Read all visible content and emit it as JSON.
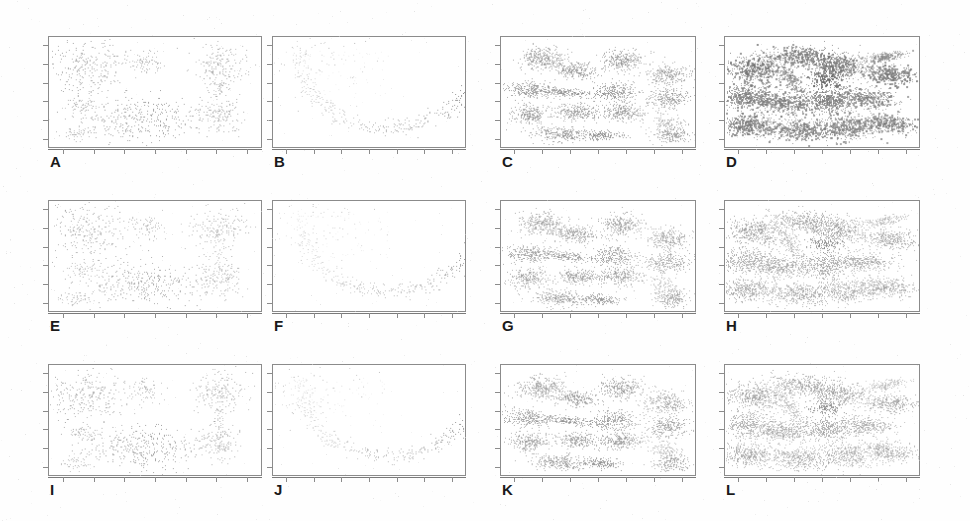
{
  "figure": {
    "width": 970,
    "height": 521,
    "background": "#ffffff",
    "rows": 3,
    "columns": 4,
    "frame_color": "#8b8b8b",
    "label_color": "#1a1a1a"
  },
  "panels": [
    {
      "id": "A",
      "label": "A",
      "row": 0,
      "col": 0,
      "dataset": "blobs-varied",
      "method": "row-1",
      "point_color": "#b9b9b9",
      "density": "sparse"
    },
    {
      "id": "B",
      "label": "B",
      "row": 0,
      "col": 1,
      "dataset": "crescent-arc",
      "method": "row-1",
      "point_color": "#bdbdbd",
      "density": "sparse"
    },
    {
      "id": "C",
      "label": "C",
      "row": 0,
      "col": 2,
      "dataset": "anisotropic-grid",
      "method": "row-1",
      "point_color": "#9a9a9a",
      "density": "dense"
    },
    {
      "id": "D",
      "label": "D",
      "row": 0,
      "col": 3,
      "dataset": "overlapping-mix",
      "method": "row-1",
      "point_color": "#7d7d7d",
      "density": "very-dense"
    },
    {
      "id": "E",
      "label": "E",
      "row": 1,
      "col": 0,
      "dataset": "blobs-varied",
      "method": "row-2",
      "point_color": "#c4c4c4",
      "density": "sparse"
    },
    {
      "id": "F",
      "label": "F",
      "row": 1,
      "col": 1,
      "dataset": "crescent-arc",
      "method": "row-2",
      "point_color": "#c6c6c6",
      "density": "sparse"
    },
    {
      "id": "G",
      "label": "G",
      "row": 1,
      "col": 2,
      "dataset": "anisotropic-grid",
      "method": "row-2",
      "point_color": "#a6a6a6",
      "density": "dense"
    },
    {
      "id": "H",
      "label": "H",
      "row": 1,
      "col": 3,
      "dataset": "overlapping-mix",
      "method": "row-2",
      "point_color": "#9d9d9d",
      "density": "dense"
    },
    {
      "id": "I",
      "label": "I",
      "row": 2,
      "col": 0,
      "dataset": "blobs-varied",
      "method": "row-3",
      "point_color": "#bfbfbf",
      "density": "sparse"
    },
    {
      "id": "J",
      "label": "J",
      "row": 2,
      "col": 1,
      "dataset": "crescent-arc",
      "method": "row-3",
      "point_color": "#c2c2c2",
      "density": "sparse"
    },
    {
      "id": "K",
      "label": "K",
      "row": 2,
      "col": 2,
      "dataset": "anisotropic-grid",
      "method": "row-3",
      "point_color": "#a2a2a2",
      "density": "dense"
    },
    {
      "id": "L",
      "label": "L",
      "row": 2,
      "col": 3,
      "dataset": "overlapping-mix",
      "method": "row-3",
      "point_color": "#a0a0a0",
      "density": "dense"
    }
  ],
  "layout": {
    "panel_boxes": [
      {
        "id": "A",
        "x": 48,
        "y": 36,
        "w": 214,
        "h": 112
      },
      {
        "id": "B",
        "x": 272,
        "y": 36,
        "w": 194,
        "h": 112
      },
      {
        "id": "C",
        "x": 500,
        "y": 36,
        "w": 196,
        "h": 112
      },
      {
        "id": "D",
        "x": 724,
        "y": 36,
        "w": 196,
        "h": 112
      },
      {
        "id": "E",
        "x": 48,
        "y": 200,
        "w": 214,
        "h": 112
      },
      {
        "id": "F",
        "x": 272,
        "y": 200,
        "w": 194,
        "h": 112
      },
      {
        "id": "G",
        "x": 500,
        "y": 200,
        "w": 196,
        "h": 112
      },
      {
        "id": "H",
        "x": 724,
        "y": 200,
        "w": 196,
        "h": 112
      },
      {
        "id": "I",
        "x": 48,
        "y": 364,
        "w": 214,
        "h": 112
      },
      {
        "id": "J",
        "x": 272,
        "y": 364,
        "w": 194,
        "h": 112
      },
      {
        "id": "K",
        "x": 500,
        "y": 364,
        "w": 196,
        "h": 112
      },
      {
        "id": "L",
        "x": 724,
        "y": 364,
        "w": 196,
        "h": 112
      }
    ],
    "label_offset": {
      "dx": 2,
      "dy": 6
    },
    "bottom_ticks": 7,
    "left_ticks": 6
  },
  "chart_data": {
    "type": "scatter",
    "title": "",
    "xlabel": "",
    "ylabel": "",
    "grid": false,
    "legend": "none",
    "axis_ticks_only": true,
    "xlim": [
      0,
      1
    ],
    "ylim": [
      0,
      1
    ],
    "panel_count": 12,
    "panel_labels": [
      "A",
      "B",
      "C",
      "D",
      "E",
      "F",
      "G",
      "H",
      "I",
      "J",
      "K",
      "L"
    ],
    "column_datasets": [
      "blobs-varied",
      "crescent-arc",
      "anisotropic-grid",
      "overlapping-mix"
    ],
    "row_variants": [
      "row-1",
      "row-2",
      "row-3"
    ],
    "clusters": {
      "blobs-varied": [
        {
          "cx": 0.18,
          "cy": 0.72,
          "sx": 0.095,
          "sy": 0.13,
          "rot": 0,
          "n": 330,
          "shade": 0.7
        },
        {
          "cx": 0.46,
          "cy": 0.77,
          "sx": 0.048,
          "sy": 0.055,
          "rot": 0,
          "n": 95,
          "shade": 0.62
        },
        {
          "cx": 0.8,
          "cy": 0.75,
          "sx": 0.062,
          "sy": 0.1,
          "rot": 0,
          "n": 230,
          "shade": 0.66
        },
        {
          "cx": 0.8,
          "cy": 0.3,
          "sx": 0.05,
          "sy": 0.085,
          "rot": 0,
          "n": 180,
          "shade": 0.66
        },
        {
          "cx": 0.8,
          "cy": 0.52,
          "sx": 0.012,
          "sy": 0.07,
          "rot": 0,
          "n": 40,
          "shade": 0.55
        },
        {
          "cx": 0.44,
          "cy": 0.25,
          "sx": 0.14,
          "sy": 0.095,
          "rot": 0,
          "n": 430,
          "shade": 0.74
        },
        {
          "cx": 0.16,
          "cy": 0.38,
          "sx": 0.04,
          "sy": 0.035,
          "rot": 0,
          "n": 70,
          "shade": 0.6
        },
        {
          "cx": 0.12,
          "cy": 0.12,
          "sx": 0.035,
          "sy": 0.035,
          "rot": 0,
          "n": 65,
          "shade": 0.6
        }
      ],
      "crescent-arc": [
        {
          "cx": 0.5,
          "cy": 0.5,
          "sx": 0.0,
          "sy": 0.0,
          "rot": 0,
          "n": 0,
          "shade": 0.0
        }
      ],
      "anisotropic-grid": [
        {
          "cx": 0.21,
          "cy": 0.8,
          "sx": 0.06,
          "sy": 0.05,
          "rot": -10,
          "n": 300,
          "shade": 0.58
        },
        {
          "cx": 0.38,
          "cy": 0.7,
          "sx": 0.055,
          "sy": 0.035,
          "rot": -8,
          "n": 220,
          "shade": 0.6
        },
        {
          "cx": 0.62,
          "cy": 0.79,
          "sx": 0.055,
          "sy": 0.05,
          "rot": 0,
          "n": 270,
          "shade": 0.58
        },
        {
          "cx": 0.86,
          "cy": 0.66,
          "sx": 0.055,
          "sy": 0.05,
          "rot": 0,
          "n": 250,
          "shade": 0.55
        },
        {
          "cx": 0.14,
          "cy": 0.52,
          "sx": 0.062,
          "sy": 0.04,
          "rot": -6,
          "n": 250,
          "shade": 0.58
        },
        {
          "cx": 0.33,
          "cy": 0.5,
          "sx": 0.075,
          "sy": 0.02,
          "rot": -10,
          "n": 180,
          "shade": 0.62
        },
        {
          "cx": 0.58,
          "cy": 0.5,
          "sx": 0.058,
          "sy": 0.045,
          "rot": 0,
          "n": 260,
          "shade": 0.58
        },
        {
          "cx": 0.86,
          "cy": 0.44,
          "sx": 0.055,
          "sy": 0.048,
          "rot": 0,
          "n": 250,
          "shade": 0.55
        },
        {
          "cx": 0.14,
          "cy": 0.3,
          "sx": 0.05,
          "sy": 0.045,
          "rot": 0,
          "n": 220,
          "shade": 0.58
        },
        {
          "cx": 0.39,
          "cy": 0.32,
          "sx": 0.06,
          "sy": 0.035,
          "rot": -5,
          "n": 220,
          "shade": 0.6
        },
        {
          "cx": 0.62,
          "cy": 0.32,
          "sx": 0.058,
          "sy": 0.04,
          "rot": 0,
          "n": 240,
          "shade": 0.58
        },
        {
          "cx": 0.85,
          "cy": 0.22,
          "sx": 0.042,
          "sy": 0.055,
          "rot": 35,
          "n": 120,
          "shade": 0.45
        },
        {
          "cx": 0.3,
          "cy": 0.12,
          "sx": 0.07,
          "sy": 0.035,
          "rot": -6,
          "n": 250,
          "shade": 0.6
        },
        {
          "cx": 0.52,
          "cy": 0.11,
          "sx": 0.055,
          "sy": 0.022,
          "rot": -4,
          "n": 150,
          "shade": 0.64
        },
        {
          "cx": 0.88,
          "cy": 0.11,
          "sx": 0.045,
          "sy": 0.04,
          "rot": 0,
          "n": 180,
          "shade": 0.55
        }
      ],
      "overlapping-mix": [
        {
          "cx": 0.16,
          "cy": 0.72,
          "sx": 0.08,
          "sy": 0.06,
          "rot": -8,
          "n": 420,
          "shade": 0.55
        },
        {
          "cx": 0.4,
          "cy": 0.82,
          "sx": 0.085,
          "sy": 0.045,
          "rot": -6,
          "n": 380,
          "shade": 0.52
        },
        {
          "cx": 0.58,
          "cy": 0.74,
          "sx": 0.07,
          "sy": 0.055,
          "rot": 0,
          "n": 350,
          "shade": 0.55
        },
        {
          "cx": 0.82,
          "cy": 0.82,
          "sx": 0.06,
          "sy": 0.022,
          "rot": 18,
          "n": 160,
          "shade": 0.38
        },
        {
          "cx": 0.84,
          "cy": 0.66,
          "sx": 0.075,
          "sy": 0.045,
          "rot": -10,
          "n": 320,
          "shade": 0.52
        },
        {
          "cx": 0.34,
          "cy": 0.6,
          "sx": 0.022,
          "sy": 0.075,
          "rot": 18,
          "n": 150,
          "shade": 0.4
        },
        {
          "cx": 0.12,
          "cy": 0.46,
          "sx": 0.07,
          "sy": 0.06,
          "rot": 0,
          "n": 400,
          "shade": 0.48
        },
        {
          "cx": 0.3,
          "cy": 0.4,
          "sx": 0.07,
          "sy": 0.04,
          "rot": -12,
          "n": 330,
          "shade": 0.5
        },
        {
          "cx": 0.52,
          "cy": 0.42,
          "sx": 0.065,
          "sy": 0.06,
          "rot": 0,
          "n": 380,
          "shade": 0.5
        },
        {
          "cx": 0.72,
          "cy": 0.45,
          "sx": 0.08,
          "sy": 0.045,
          "rot": -8,
          "n": 340,
          "shade": 0.48
        },
        {
          "cx": 0.12,
          "cy": 0.2,
          "sx": 0.07,
          "sy": 0.05,
          "rot": 0,
          "n": 360,
          "shade": 0.52
        },
        {
          "cx": 0.38,
          "cy": 0.16,
          "sx": 0.085,
          "sy": 0.05,
          "rot": -4,
          "n": 400,
          "shade": 0.48
        },
        {
          "cx": 0.62,
          "cy": 0.18,
          "sx": 0.075,
          "sy": 0.055,
          "rot": 0,
          "n": 380,
          "shade": 0.46
        },
        {
          "cx": 0.84,
          "cy": 0.22,
          "sx": 0.07,
          "sy": 0.045,
          "rot": -8,
          "n": 320,
          "shade": 0.5
        },
        {
          "cx": 0.52,
          "cy": 0.62,
          "sx": 0.045,
          "sy": 0.035,
          "rot": 0,
          "n": 120,
          "shade": 0.72
        }
      ]
    },
    "arc": {
      "description": "Upper-left sparse cloud plus a dense lower U-shaped crescent sweeping from upper-left down through bottom-centre and back up to the right edge.",
      "center": [
        0.6,
        0.8
      ],
      "radius_x": 0.46,
      "radius_y": 0.62,
      "angle_start": 172,
      "angle_end": 350,
      "thickness": 0.055,
      "n_points": 420,
      "cloud": {
        "cx": 0.22,
        "cy": 0.75,
        "sx": 0.14,
        "sy": 0.14,
        "n": 110
      }
    }
  }
}
